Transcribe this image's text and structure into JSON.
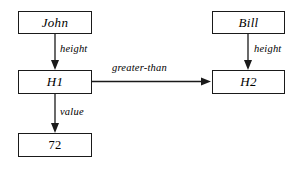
{
  "diagram": {
    "background_color": "#ffffff",
    "line_color": "#1a1a1a",
    "nodes": [
      {
        "id": "john",
        "label": "John",
        "style": "italic",
        "x": 18,
        "y": 11,
        "w": 74,
        "h": 23
      },
      {
        "id": "h1",
        "label": "H1",
        "style": "italic",
        "x": 18,
        "y": 70,
        "w": 74,
        "h": 24
      },
      {
        "id": "value72",
        "label": "72",
        "style": "plain",
        "x": 18,
        "y": 133,
        "w": 74,
        "h": 24
      },
      {
        "id": "bill",
        "label": "Bill",
        "style": "italic",
        "x": 212,
        "y": 11,
        "w": 73,
        "h": 23
      },
      {
        "id": "h2",
        "label": "H2",
        "style": "italic",
        "x": 212,
        "y": 70,
        "w": 73,
        "h": 24
      }
    ],
    "edges": [
      {
        "id": "john-height-h1",
        "label": "height",
        "from": "john",
        "to": "h1",
        "direction": "down",
        "label_x": 60,
        "label_y": 43
      },
      {
        "id": "h1-value-72",
        "label": "value",
        "from": "h1",
        "to": "value72",
        "direction": "down",
        "label_x": 60,
        "label_y": 106
      },
      {
        "id": "bill-height-h2",
        "label": "height",
        "from": "bill",
        "to": "h2",
        "direction": "down",
        "label_x": 254,
        "label_y": 43
      },
      {
        "id": "h1-greaterthan-h2",
        "label": "greater-than",
        "from": "h1",
        "to": "h2",
        "direction": "right",
        "label_x": 112,
        "label_y": 62
      }
    ]
  }
}
